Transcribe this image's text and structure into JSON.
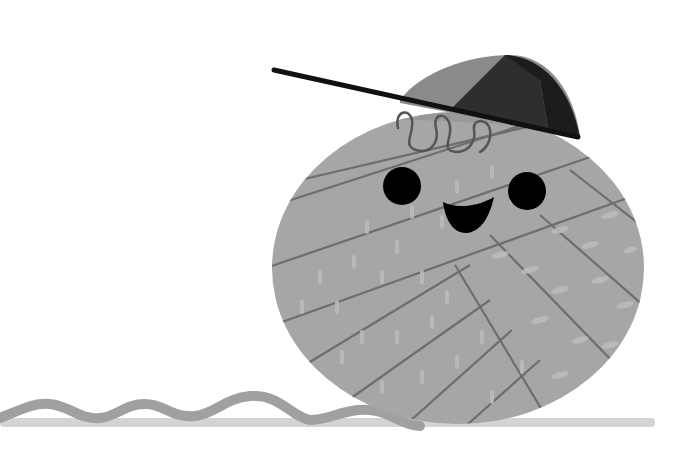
{
  "scene": {
    "description": "Cartoon yarn ball character wearing a sideways baseball cap, grayscale illustration",
    "colors": {
      "background": "#ffffff",
      "yarn": "#a6a6a6",
      "yarn_line": "#6e6e6e",
      "yarn_highlight": "#bdbdbd",
      "yarn_upper_band": "#9a9a9a",
      "cap_light": "#8a8a8a",
      "cap_dark": "#2e2e2e",
      "cap_darker": "#1c1c1c",
      "visor": "#111111",
      "eyes": "#000000",
      "mouth": "#000000",
      "curl": "#555555",
      "string": "#a0a0a0",
      "shadow": "#d4d4d4"
    },
    "elements": [
      "yarn-ball",
      "cap",
      "eyes",
      "smile",
      "hair-curl",
      "loose-yarn-string",
      "ground-shadow"
    ]
  }
}
